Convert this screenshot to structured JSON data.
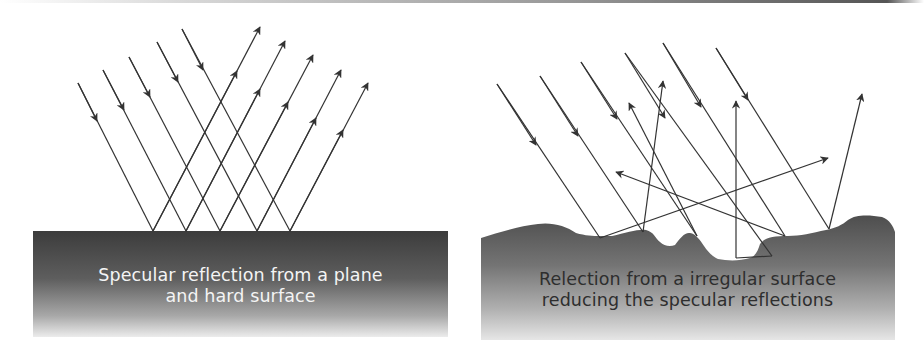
{
  "figure": {
    "panels": [
      {
        "id": "specular",
        "caption_line1": "Specular reflection from a plane",
        "caption_line2": "and hard surface",
        "surface_type": "flat",
        "caption_color": "#f4f4f4",
        "surface_gradient": [
          "#3c3c3c",
          "#6a6a6a",
          "#dcdcdc"
        ]
      },
      {
        "id": "diffuse",
        "caption_line1": "Relection from a irregular surface",
        "caption_line2": "reducing the specular reflections",
        "surface_type": "irregular",
        "caption_color": "#2e2e2e",
        "surface_gradient": [
          "#555555",
          "#8a8a8a",
          "#e0e0e0"
        ]
      }
    ],
    "ray_color": "#333333"
  }
}
